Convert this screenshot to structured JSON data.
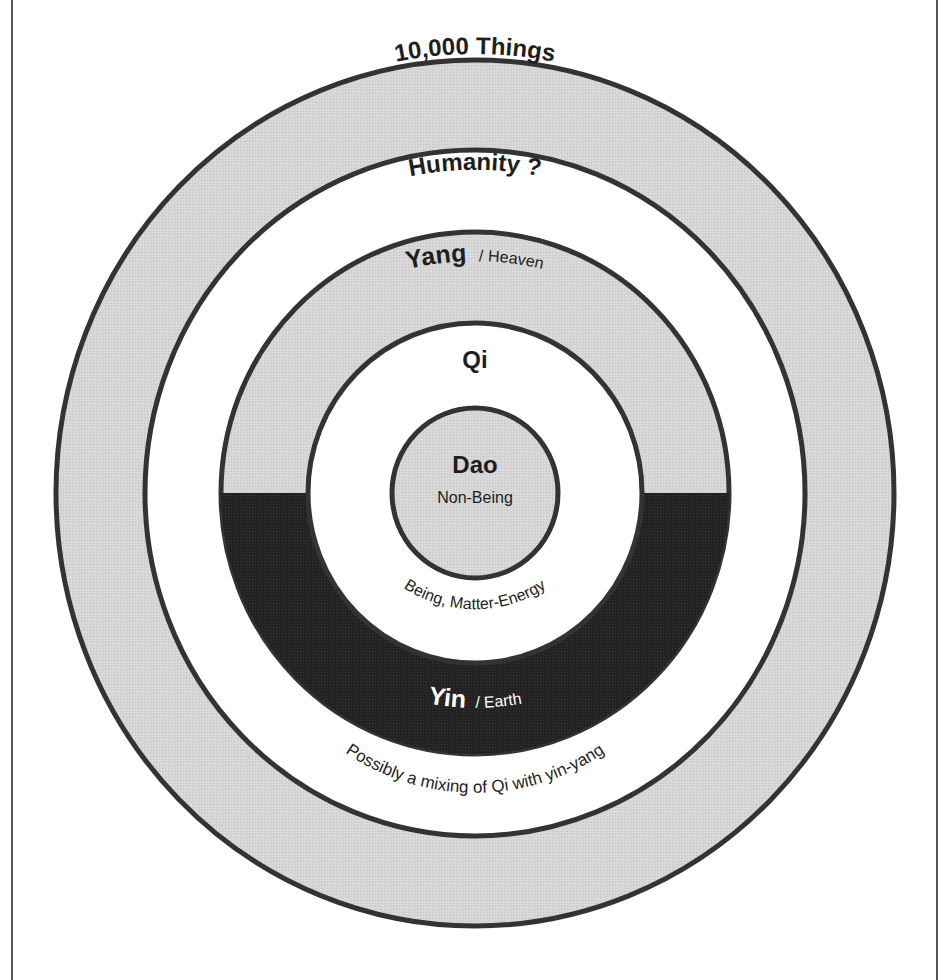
{
  "diagram": {
    "colors": {
      "background": "#ffffff",
      "light_gray_fill": "#d9d9d9",
      "dark_fill": "#262626",
      "stroke": "#333333",
      "frame_line": "#555555"
    },
    "rings": [
      {
        "id": "outer",
        "label": "10,000 Things",
        "fill": "light_gray"
      },
      {
        "id": "humanity",
        "label": "Humanity ?",
        "fill": "white"
      },
      {
        "id": "yin-yang",
        "upper": {
          "label_main": "Yang",
          "label_sub": "/ Heaven",
          "fill": "light_gray"
        },
        "lower": {
          "label_main": "Yin",
          "label_sub": "/ Earth",
          "fill": "dark"
        }
      },
      {
        "id": "qi",
        "label": "Qi",
        "fill": "white"
      },
      {
        "id": "dao",
        "label": "Dao",
        "sublabel": "Non-Being",
        "fill": "light_gray"
      }
    ],
    "labels": {
      "outer": "10,000 Things",
      "humanity": "Humanity ?",
      "yang_main": "Yang",
      "yang_sub": "/ Heaven",
      "qi": "Qi",
      "dao": "Dao",
      "dao_sub": "Non-Being",
      "qi_lower": "Being, Matter-Energy",
      "yin_main": "Yin",
      "yin_sub": "/ Earth",
      "humanity_lower": "Possibly a mixing of Qi with yin-yang"
    }
  }
}
